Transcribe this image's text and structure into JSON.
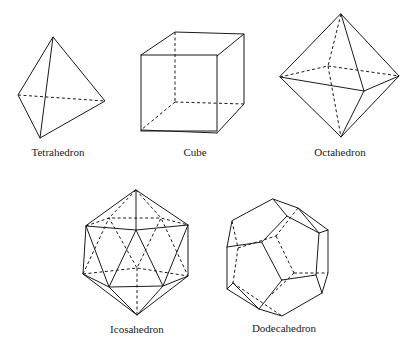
{
  "figure": {
    "solids": [
      {
        "id": "tetrahedron",
        "label": "Tetrahedron"
      },
      {
        "id": "cube",
        "label": "Cube"
      },
      {
        "id": "octahedron",
        "label": "Octahedron"
      },
      {
        "id": "icosahedron",
        "label": "Icosahedron"
      },
      {
        "id": "dodecahedron",
        "label": "Dodecahedron"
      }
    ],
    "line_color": "#1a1a1a",
    "background": "#ffffff"
  }
}
